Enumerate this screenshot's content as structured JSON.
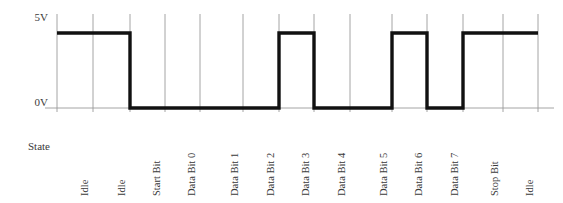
{
  "figure": {
    "axis": {
      "y_labels": [
        {
          "text": "5V",
          "value": 5,
          "y": 17
        },
        {
          "text": "0V",
          "value": 0,
          "y": 102
        }
      ],
      "row_label": "State"
    },
    "colors": {
      "signal": "#111111",
      "grid": "#9a9a9a",
      "background": "#ffffff",
      "text": "#3a3a3a"
    },
    "geometry": {
      "high_y": 33,
      "low_y": 108,
      "grid_top_y": 14,
      "grid_bottom_y": 112,
      "label_baseline_y": 196,
      "cell_edges": [
        57,
        93,
        130,
        165,
        200,
        243,
        279,
        314,
        350,
        392,
        427,
        463,
        503,
        538
      ]
    }
  },
  "chart_data": {
    "type": "line",
    "xlabel": "State",
    "ylabel": "",
    "ylim": [
      0,
      5
    ],
    "yticks": [
      0,
      5
    ],
    "ytick_labels": [
      "0V",
      "5V"
    ],
    "grid": true,
    "legend": "none",
    "protocol": "UART 8N1",
    "signal_levels": {
      "high": "5V",
      "low": "0V"
    },
    "categories": [
      "Idle",
      "Idle",
      "Start Bit",
      "Data Bit 0",
      "Data Bit 1",
      "Data Bit 2",
      "Data Bit 3",
      "Data Bit 4",
      "Data Bit 5",
      "Data Bit 6",
      "Data Bit 7",
      "Stop Bit",
      "Idle"
    ],
    "values": [
      5,
      5,
      0,
      0,
      0,
      0,
      5,
      0,
      0,
      5,
      0,
      5,
      5
    ],
    "bits": [
      1,
      1,
      0,
      0,
      0,
      0,
      1,
      0,
      0,
      1,
      0,
      1,
      1
    ],
    "data_bits_lsb_first": [
      0,
      0,
      0,
      1,
      0,
      0,
      1,
      0
    ],
    "series": [
      {
        "name": "TX line",
        "values": [
          5,
          5,
          0,
          0,
          0,
          0,
          5,
          0,
          0,
          5,
          0,
          5,
          5
        ]
      }
    ],
    "cells": [
      {
        "index": 0,
        "label": "Idle",
        "level": "5V",
        "bit": 1,
        "x0": 57,
        "x1": 93
      },
      {
        "index": 1,
        "label": "Idle",
        "level": "5V",
        "bit": 1,
        "x0": 93,
        "x1": 130
      },
      {
        "index": 2,
        "label": "Start Bit",
        "level": "0V",
        "bit": 0,
        "x0": 130,
        "x1": 165
      },
      {
        "index": 3,
        "label": "Data Bit 0",
        "level": "0V",
        "bit": 0,
        "x0": 165,
        "x1": 200
      },
      {
        "index": 4,
        "label": "Data Bit 1",
        "level": "0V",
        "bit": 0,
        "x0": 200,
        "x1": 243
      },
      {
        "index": 5,
        "label": "Data Bit 2",
        "level": "0V",
        "bit": 0,
        "x0": 243,
        "x1": 279
      },
      {
        "index": 6,
        "label": "Data Bit 3",
        "level": "5V",
        "bit": 1,
        "x0": 279,
        "x1": 314
      },
      {
        "index": 7,
        "label": "Data Bit 4",
        "level": "0V",
        "bit": 0,
        "x0": 314,
        "x1": 350
      },
      {
        "index": 8,
        "label": "Data Bit 5",
        "level": "0V",
        "bit": 0,
        "x0": 350,
        "x1": 392
      },
      {
        "index": 9,
        "label": "Data Bit 6",
        "level": "5V",
        "bit": 1,
        "x0": 392,
        "x1": 427
      },
      {
        "index": 10,
        "label": "Data Bit 7",
        "level": "0V",
        "bit": 0,
        "x0": 427,
        "x1": 463
      },
      {
        "index": 11,
        "label": "Stop Bit",
        "level": "5V",
        "bit": 1,
        "x0": 463,
        "x1": 503
      },
      {
        "index": 12,
        "label": "Idle",
        "level": "5V",
        "bit": 1,
        "x0": 503,
        "x1": 538
      }
    ]
  }
}
